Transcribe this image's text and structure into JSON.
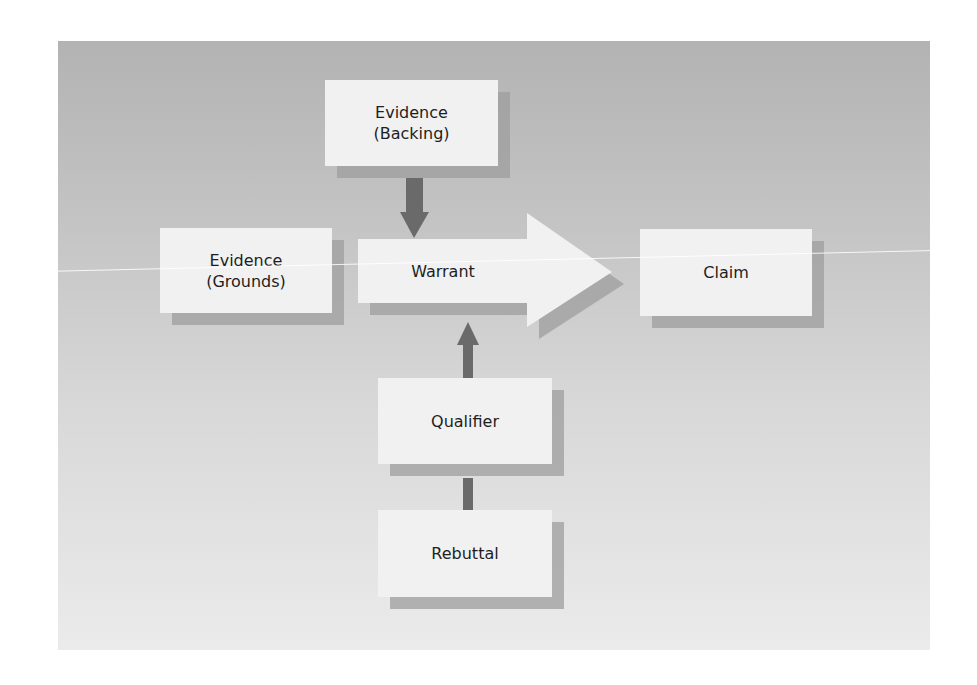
{
  "diagram": {
    "nodes": [
      {
        "id": "backing",
        "label": "Evidence\n(Backing)"
      },
      {
        "id": "grounds",
        "label": "Evidence\n(Grounds)"
      },
      {
        "id": "warrant",
        "label": "Warrant"
      },
      {
        "id": "claim",
        "label": "Claim"
      },
      {
        "id": "qualifier",
        "label": "Qualifier"
      },
      {
        "id": "rebuttal",
        "label": "Rebuttal"
      }
    ],
    "edges": [
      {
        "from": "backing",
        "to": "warrant"
      },
      {
        "from": "grounds",
        "to": "claim",
        "via": "warrant"
      },
      {
        "from": "qualifier",
        "to": "warrant"
      },
      {
        "from": "rebuttal",
        "to": "qualifier"
      }
    ],
    "colors": {
      "background_top": "#b3b3b3",
      "background_bottom": "#ebebeb",
      "box_fill": "#f1f1f1",
      "shadow": "#9e9e9e",
      "arrow": "#6a6a6a",
      "text": "#1e1e1e"
    }
  }
}
